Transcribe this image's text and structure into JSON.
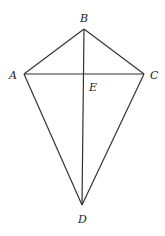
{
  "diagram": {
    "type": "kite",
    "points": {
      "A": {
        "label": "A",
        "x": 24,
        "y": 74
      },
      "B": {
        "label": "B",
        "x": 84,
        "y": 29
      },
      "C": {
        "label": "C",
        "x": 144,
        "y": 74
      },
      "D": {
        "label": "D",
        "x": 82,
        "y": 205
      },
      "E": {
        "label": "E",
        "x": 84,
        "y": 74
      }
    },
    "segments": [
      "AB",
      "BC",
      "CD",
      "DA",
      "AC",
      "BD"
    ]
  }
}
